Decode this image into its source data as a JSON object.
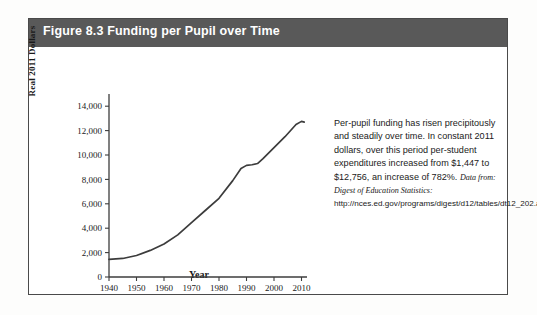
{
  "figure": {
    "title": "Figure 8.3  Funding per Pupil over Time",
    "header_color": "#595959",
    "border_color": "#4a4a4a"
  },
  "caption": {
    "body": "Per-pupil funding has risen precipitously and steadily over time. In constant 2011 dollars, over this period per-student expenditures increased from $1,447 to $12,756, an increase of 782%.",
    "source_prefix": "Data from: Digest of Education Statistics:",
    "source_url": "http://nces.ed.gov/programs/digest/d12/tables/dt12_202.asp."
  },
  "chart_data": {
    "type": "line",
    "title": "Funding per Pupil over Time",
    "xlabel": "Year",
    "ylabel": "Real 2011 Dollars",
    "xlim": [
      1940,
      2012
    ],
    "ylim": [
      0,
      15000
    ],
    "xticks": [
      "1940",
      "1950",
      "1960",
      "1970",
      "1980",
      "1990",
      "2000",
      "2010"
    ],
    "xtick_values": [
      1940,
      1950,
      1960,
      1970,
      1980,
      1990,
      2000,
      2010
    ],
    "yticks": [
      "0",
      "2,000",
      "4,000",
      "6,000",
      "8,000",
      "10,000",
      "12,000",
      "14,000"
    ],
    "ytick_values": [
      0,
      2000,
      4000,
      6000,
      8000,
      10000,
      12000,
      14000
    ],
    "grid": false,
    "legend": "none",
    "line_color": "#3c3c3c",
    "series": [
      {
        "name": "Real per-pupil expenditure (2011 dollars)",
        "x": [
          1940,
          1945,
          1950,
          1955,
          1960,
          1965,
          1970,
          1975,
          1980,
          1985,
          1988,
          1990,
          1992,
          1994,
          1996,
          2000,
          2004,
          2008,
          2010,
          2011
        ],
        "values": [
          1447,
          1520,
          1760,
          2180,
          2700,
          3450,
          4450,
          5450,
          6450,
          7900,
          8900,
          9150,
          9200,
          9300,
          9700,
          10600,
          11500,
          12500,
          12756,
          12700
        ]
      }
    ],
    "annotations": {
      "start_value": "$1,447",
      "end_value": "$12,756",
      "percent_increase": "782%"
    }
  }
}
